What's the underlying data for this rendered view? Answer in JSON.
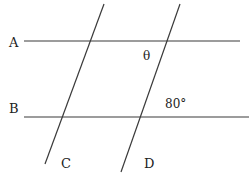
{
  "diagram": {
    "lines": {
      "A": {
        "label": "A",
        "x1": 24,
        "y1": 41,
        "x2": 240,
        "y2": 41
      },
      "B": {
        "label": "B",
        "x1": 24,
        "y1": 117,
        "x2": 249,
        "y2": 117
      },
      "C": {
        "label": "C",
        "x1": 104,
        "y1": 4,
        "x2": 45,
        "y2": 164
      },
      "D": {
        "label": "D",
        "x1": 180,
        "y1": 4,
        "x2": 121,
        "y2": 172
      }
    },
    "angles": {
      "theta": {
        "label": "θ"
      },
      "given": {
        "label": "80°"
      }
    },
    "stroke_color": "#3a3a3a"
  }
}
